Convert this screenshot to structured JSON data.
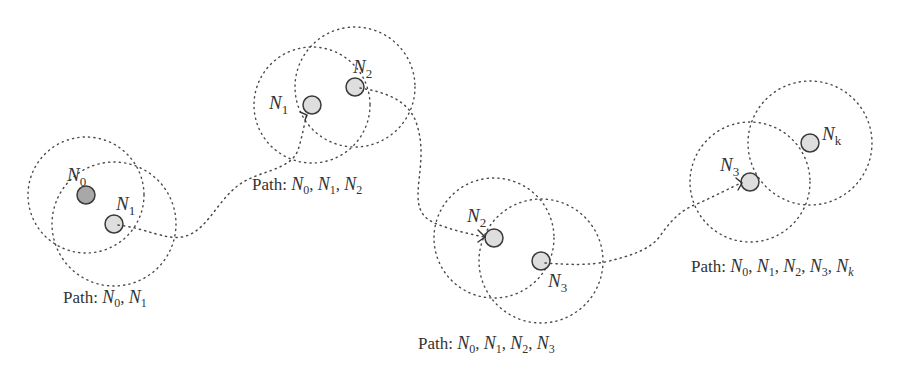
{
  "diagram": {
    "colors": {
      "background": "#ffffff",
      "stroke": "#4a4a4a",
      "source_node_fill": "#a8a8a8",
      "node_fill": "#dedede",
      "text": "#333333"
    },
    "stages": [
      {
        "caption": {
          "prefix": "Path: ",
          "nodes": [
            [
              "N",
              "0"
            ],
            [
              "N",
              "1"
            ]
          ]
        },
        "nodes": [
          {
            "id": "N0",
            "label": "N",
            "sub": "0",
            "x": 86,
            "y": 195,
            "r": 9,
            "range_r": 58,
            "source": true
          },
          {
            "id": "N1",
            "label": "N",
            "sub": "1",
            "x": 114,
            "y": 224,
            "r": 9,
            "range_r": 62
          }
        ]
      },
      {
        "caption": {
          "prefix": "Path: ",
          "nodes": [
            [
              "N",
              "0"
            ],
            [
              "N",
              "1"
            ],
            [
              "N",
              "2"
            ]
          ]
        },
        "nodes": [
          {
            "id": "N1",
            "label": "N",
            "sub": "1",
            "x": 312,
            "y": 105,
            "r": 9,
            "range_r": 58
          },
          {
            "id": "N2",
            "label": "N",
            "sub": "2",
            "x": 355,
            "y": 87,
            "r": 9,
            "range_r": 60
          }
        ]
      },
      {
        "caption": {
          "prefix": "Path: ",
          "nodes": [
            [
              "N",
              "0"
            ],
            [
              "N",
              "1"
            ],
            [
              "N",
              "2"
            ],
            [
              "N",
              "3"
            ]
          ]
        },
        "nodes": [
          {
            "id": "N2",
            "label": "N",
            "sub": "2",
            "x": 494,
            "y": 238,
            "r": 9,
            "range_r": 60
          },
          {
            "id": "N3",
            "label": "N",
            "sub": "3",
            "x": 541,
            "y": 261,
            "r": 9,
            "range_r": 62
          }
        ]
      },
      {
        "caption": {
          "prefix": "Path: ",
          "nodes": [
            [
              "N",
              "0"
            ],
            [
              "N",
              "1"
            ],
            [
              "N",
              "2"
            ],
            [
              "N",
              "3"
            ],
            [
              "N",
              "k"
            ]
          ]
        },
        "nodes": [
          {
            "id": "N3",
            "label": "N",
            "sub": "3",
            "x": 750,
            "y": 182,
            "r": 9,
            "range_r": 60
          },
          {
            "id": "Nk",
            "label": "N",
            "sub": "k",
            "x": 810,
            "y": 143,
            "r": 9,
            "range_r": 62
          }
        ]
      }
    ],
    "text": {
      "stage0": {
        "prefix": "Path: ",
        "n": "N",
        "s0": "0",
        "s1": "1",
        "sep": ", "
      },
      "stage1": {
        "prefix": "Path: ",
        "n": "N",
        "s0": "0",
        "s1": "1",
        "s2": "2",
        "sep": ", "
      },
      "stage2": {
        "prefix": "Path: ",
        "n": "N",
        "s0": "0",
        "s1": "1",
        "s2": "2",
        "s3": "3",
        "sep": ", "
      },
      "stage3": {
        "prefix": "Path: ",
        "n": "N",
        "s0": "0",
        "s1": "1",
        "s2": "2",
        "s3": "3",
        "sk": "k",
        "sep": ", "
      },
      "node_labels": {
        "n": "N",
        "g0_a": "0",
        "g0_b": "1",
        "g1_a": "1",
        "g1_b": "2",
        "g2_a": "2",
        "g2_b": "3",
        "g3_a": "3",
        "g3_b": "k"
      }
    }
  }
}
